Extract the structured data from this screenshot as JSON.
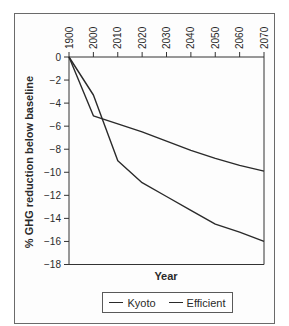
{
  "chart_data": {
    "type": "line",
    "title": "",
    "xlabel": "Year",
    "ylabel": "% GHG reduction below baseline",
    "x_tick_labels": [
      "1900",
      "2000",
      "2010",
      "2020",
      "2030",
      "2040",
      "2050",
      "2060",
      "2070"
    ],
    "x_axis_position": "top",
    "y_ticks": [
      0,
      -2,
      -4,
      -6,
      -8,
      -10,
      -12,
      -14,
      -16,
      -18
    ],
    "y_tick_labels": [
      "0",
      "−2",
      "−4",
      "−6",
      "−8",
      "−10",
      "−12",
      "−14",
      "−16",
      "−18"
    ],
    "ylim": [
      -18,
      0
    ],
    "grid": false,
    "legend_position": "bottom",
    "x": [
      "1900",
      "2000",
      "2010",
      "2020",
      "2030",
      "2040",
      "2050",
      "2060",
      "2070"
    ],
    "series": [
      {
        "name": "Kyoto",
        "values": [
          0,
          -3.3,
          -9.0,
          -10.9,
          -12.1,
          -13.3,
          -14.5,
          -15.2,
          -16.0
        ]
      },
      {
        "name": "Efficient",
        "values": [
          0,
          -5.1,
          -5.8,
          -6.5,
          -7.3,
          -8.1,
          -8.8,
          -9.4,
          -9.9
        ]
      }
    ]
  },
  "legend": {
    "items": [
      "Kyoto",
      "Efficient"
    ]
  }
}
